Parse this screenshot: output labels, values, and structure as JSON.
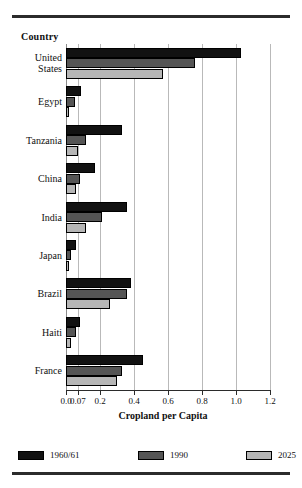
{
  "header": {
    "category_axis_title": "Country"
  },
  "chart_data": {
    "type": "bar",
    "orientation": "horizontal",
    "title": "",
    "xlabel": "Cropland per Capita",
    "ylabel": "Country",
    "xlim": [
      0.0,
      1.2
    ],
    "xticks": [
      "0.0",
      "0.07",
      "0.2",
      "0.4",
      "0.6",
      "0.8",
      "1.0",
      "1.2"
    ],
    "xtick_values": [
      0.0,
      0.07,
      0.2,
      0.4,
      0.6,
      0.8,
      1.0,
      1.2
    ],
    "grid": true,
    "legend_position": "bottom",
    "categories": [
      "United States",
      "Egypt",
      "Tanzania",
      "China",
      "India",
      "Japan",
      "Brazil",
      "Haiti",
      "France"
    ],
    "category_labels_multiline": [
      [
        "United",
        "States"
      ],
      [
        "Egypt"
      ],
      [
        "Tanzania"
      ],
      [
        "China"
      ],
      [
        "India"
      ],
      [
        "Japan"
      ],
      [
        "Brazil"
      ],
      [
        "Haiti"
      ],
      [
        "France"
      ]
    ],
    "series": [
      {
        "name": "1960/61",
        "color": "#121212",
        "values": [
          1.03,
          0.09,
          0.33,
          0.17,
          0.36,
          0.06,
          0.38,
          0.08,
          0.45
        ]
      },
      {
        "name": "1990",
        "color": "#555555",
        "values": [
          0.76,
          0.05,
          0.12,
          0.08,
          0.21,
          0.03,
          0.36,
          0.06,
          0.33
        ]
      },
      {
        "name": "2025",
        "color": "#b6b6b6",
        "values": [
          0.57,
          0.02,
          0.07,
          0.06,
          0.12,
          0.02,
          0.26,
          0.03,
          0.3
        ]
      }
    ]
  },
  "legend": [
    {
      "label": "1960/61"
    },
    {
      "label": "1990"
    },
    {
      "label": "2025"
    }
  ],
  "axis": {
    "x_title": "Cropland per Capita"
  }
}
